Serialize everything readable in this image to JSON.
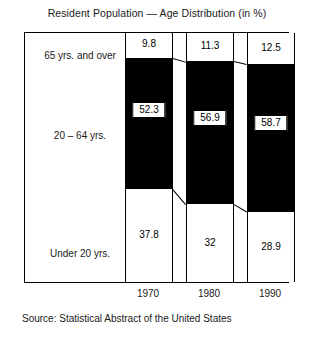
{
  "title": "Resident Population — Age Distribution (in %)",
  "source": "Source: Statistical Abstract of the United States",
  "row_labels": [
    "65 yrs. and over",
    "20 – 64 yrs.",
    "Under 20 yrs."
  ],
  "years": [
    "1970",
    "1980",
    "1990"
  ],
  "values": {
    "over65": [
      "9.8",
      "11.3",
      "12.5"
    ],
    "mid": [
      "52.3",
      "56.9",
      "58.7"
    ],
    "under20": [
      "37.8",
      "32",
      "28.9"
    ]
  },
  "colors": {
    "ink": "#000000",
    "text": "#1a1a1a",
    "paper": "#ffffff",
    "bar_fill": "#000000"
  },
  "chart_data": {
    "type": "bar",
    "title": "Resident Population — Age Distribution (in %)",
    "subtitle": "",
    "xlabel": "",
    "ylabel": "",
    "note": "Source: Statistical Abstract of the United States",
    "stacked": true,
    "grid": false,
    "legend": "row-labels-left",
    "categories": [
      "1970",
      "1980",
      "1990"
    ],
    "ylim": [
      0,
      100
    ],
    "series": [
      {
        "name": "65 yrs. and over",
        "values": [
          9.8,
          11.3,
          12.5
        ],
        "fill": "#ffffff"
      },
      {
        "name": "20 – 64 yrs.",
        "values": [
          52.3,
          56.9,
          58.7
        ],
        "fill": "#000000"
      },
      {
        "name": "Under 20 yrs.",
        "values": [
          37.8,
          32,
          28.9
        ],
        "fill": "#ffffff"
      }
    ],
    "annotations": [
      "Segment tops of adjacent bars are joined by straight connector lines."
    ]
  }
}
